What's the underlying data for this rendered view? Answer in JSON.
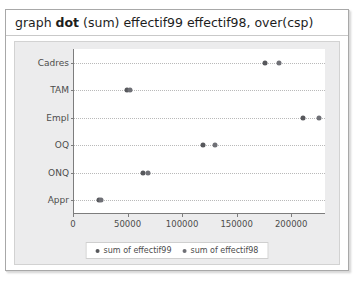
{
  "window": {
    "command_prefix": "graph ",
    "command_bold": "dot",
    "command_suffix": " (sum) effectif99 effectif98, over(csp)"
  },
  "colors": {
    "series99": "#57585c",
    "series98": "#6f7076",
    "axis": "#7d7d7d",
    "grid": "#b9b9b9",
    "panel": "#ececed"
  },
  "chart_data": {
    "type": "scatter",
    "title": "",
    "xlabel": "",
    "ylabel": "",
    "orientation": "horizontal",
    "grid": true,
    "legend_position": "bottom",
    "xlim": [
      0,
      231000
    ],
    "xticks": [
      0,
      50000,
      100000,
      150000,
      200000
    ],
    "xticklabels": [
      "0",
      "50000",
      "100000",
      "150000",
      "200000"
    ],
    "categories": [
      "Cadres",
      "TAM",
      "Empl",
      "OQ",
      "ONQ",
      "Appr"
    ],
    "series": [
      {
        "name": "sum of effectif99",
        "values": [
          175000,
          49000,
          210000,
          118000,
          63000,
          23000
        ]
      },
      {
        "name": "sum of effectif98",
        "values": [
          188000,
          51000,
          225000,
          129000,
          68000,
          25000
        ]
      }
    ]
  }
}
